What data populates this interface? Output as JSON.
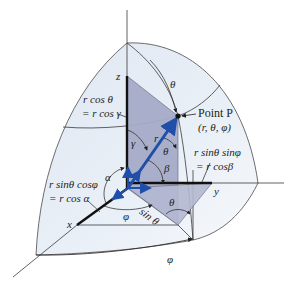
{
  "figure": {
    "colors": {
      "sphere_fill": "#e4ebf5",
      "sphere_fill_light": "#f4f7fb",
      "plane_fill": "#9fa6c3",
      "plane_fill_light": "#b9bed5",
      "vector_blue": "#1f4fa8",
      "line": "#2b2b2b"
    },
    "axes": {
      "x": "x",
      "y": "y",
      "z": "z"
    },
    "unit_vectors": {
      "z_hat": "z",
      "x_hat": "x",
      "y_hat": "y",
      "r_hat": "r"
    },
    "point": {
      "label": "Point P",
      "coords": "(r, θ, φ)"
    },
    "annotations": {
      "z_component_line1": "r cos θ",
      "z_component_line2": "= r cos γ",
      "x_component_line1": "r sinθ  cosφ",
      "x_component_line2": "= r cos α",
      "y_component_line1": "r sinθ  sinφ",
      "y_component_line2": "= r cosβ",
      "sin_theta": "sin θ"
    },
    "angles": {
      "theta_top": "θ",
      "theta_near_r": "θ",
      "theta_bottom": "θ",
      "gamma": "γ",
      "alpha": "α",
      "beta": "β",
      "phi_inner": "φ",
      "phi_outer": "φ",
      "r_label": "r"
    }
  }
}
